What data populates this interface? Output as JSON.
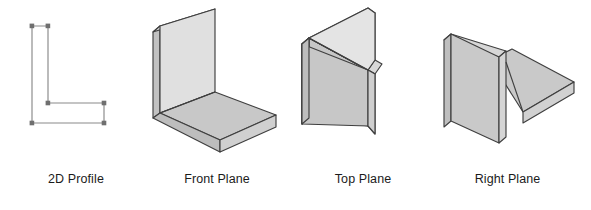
{
  "diagram": {
    "background_color": "#ffffff",
    "line_color": "#4d4d4d",
    "thin_line_color": "#808080",
    "face_light_color": "#e3e3e3",
    "face_mid_color": "#c9c9c9",
    "face_dark_color": "#b4b4b4",
    "edge_strip_color": "#d2d2d2"
  },
  "figures": [
    {
      "id": "profile",
      "label": "2D Profile",
      "kind": "2d-wireframe",
      "description": "L-shaped closed profile outline drawn with thin lines and small square vertex markers",
      "vertex_count": 6
    },
    {
      "id": "front",
      "label": "Front Plane",
      "kind": "isometric-solid",
      "description": "L-shape extruded as a vertical back plate with a horizontal base plate projecting toward the viewer"
    },
    {
      "id": "top",
      "label": "Top Plane",
      "kind": "isometric-solid",
      "description": "L-shape extruded vertically producing two plates meeting edge-on, forming a chevron seen from above"
    },
    {
      "id": "right",
      "label": "Right Plane",
      "kind": "isometric-solid",
      "description": "L-shape extruded sideways giving a tall left plate and a horizontal shelf extending to the right"
    }
  ]
}
